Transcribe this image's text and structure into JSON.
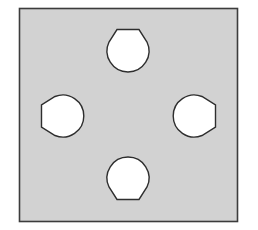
{
  "diagram": {
    "type": "plate-with-holes",
    "colors": {
      "background": "#ffffff",
      "plate_fill": "#d2d2d2",
      "plate_stroke": "#3c3c3c",
      "hole_fill": "#ffffff",
      "hole_stroke": "#2e2e2e"
    },
    "plate": {
      "x": 19,
      "y": 8,
      "width": 218,
      "height": 213
    },
    "holes": [
      {
        "name": "top",
        "cx": 128,
        "cy": 50,
        "r": 22,
        "flat_side": "top"
      },
      {
        "name": "left",
        "cx": 64,
        "cy": 116,
        "r": 22,
        "flat_side": "left"
      },
      {
        "name": "right",
        "cx": 192,
        "cy": 116,
        "r": 22,
        "flat_side": "right"
      },
      {
        "name": "bottom",
        "cx": 128,
        "cy": 178,
        "r": 22,
        "flat_side": "bottom"
      }
    ]
  }
}
